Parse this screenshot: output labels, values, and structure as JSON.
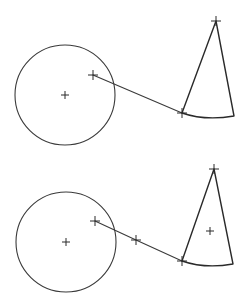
{
  "colors": {
    "background": "#ffffff",
    "stroke": "#3a3a3a"
  },
  "figures": [
    {
      "id": "top",
      "circle": {
        "cx": 65,
        "cy": 95,
        "r": 50
      },
      "center_mark": {
        "x": 65,
        "y": 95
      },
      "line": {
        "points": [
          [
            93,
            75
          ],
          [
            182,
            113
          ]
        ]
      },
      "line_marks": [
        [
          93,
          75
        ],
        [
          182,
          113
        ]
      ],
      "cone": {
        "apex": [
          216,
          21
        ],
        "left": [
          182,
          113
        ],
        "right": [
          234,
          116
        ],
        "arc_control": [
          205,
          121
        ]
      },
      "apex_mark": [
        216,
        21
      ],
      "centroid_mark": null
    },
    {
      "id": "bottom",
      "circle": {
        "cx": 66,
        "cy": 242,
        "r": 50
      },
      "center_mark": {
        "x": 66,
        "y": 242
      },
      "line": {
        "points": [
          [
            95,
            221
          ],
          [
            136,
            240
          ],
          [
            182,
            261
          ]
        ]
      },
      "line_marks": [
        [
          95,
          221
        ],
        [
          136,
          240
        ],
        [
          182,
          261
        ]
      ],
      "cone": {
        "apex": [
          214,
          169
        ],
        "left": [
          182,
          261
        ],
        "right": [
          233,
          264
        ],
        "arc_control": [
          205,
          269
        ]
      },
      "apex_mark": [
        214,
        169
      ],
      "centroid_mark": [
        210,
        231
      ]
    }
  ]
}
